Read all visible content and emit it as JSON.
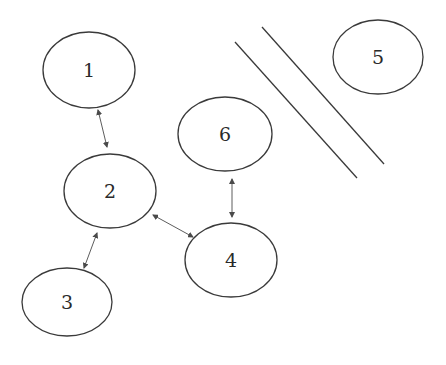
{
  "diagram": {
    "type": "node-graph",
    "colors": {
      "stroke": "#3a3a3a",
      "arrow": "#4a4a4a",
      "text": "#2a2a2a",
      "background": "#ffffff"
    },
    "nodes": [
      {
        "id": "1",
        "label": "1",
        "cx": 89,
        "cy": 70,
        "rx": 46,
        "ry": 38
      },
      {
        "id": "2",
        "label": "2",
        "cx": 110,
        "cy": 191,
        "rx": 46,
        "ry": 37
      },
      {
        "id": "3",
        "label": "3",
        "cx": 67,
        "cy": 302,
        "rx": 45,
        "ry": 34
      },
      {
        "id": "4",
        "label": "4",
        "cx": 231,
        "cy": 260,
        "rx": 46,
        "ry": 37
      },
      {
        "id": "5",
        "label": "5",
        "cx": 378,
        "cy": 57,
        "rx": 45,
        "ry": 37
      },
      {
        "id": "6",
        "label": "6",
        "cx": 225,
        "cy": 134,
        "rx": 47,
        "ry": 37
      }
    ],
    "edges": [
      {
        "from": "1",
        "to": "2",
        "bidirectional": true,
        "x1": 98,
        "y1": 110,
        "x2": 107,
        "y2": 147
      },
      {
        "from": "2",
        "to": "3",
        "bidirectional": true,
        "x1": 97,
        "y1": 233,
        "x2": 84,
        "y2": 268
      },
      {
        "from": "2",
        "to": "4",
        "bidirectional": true,
        "x1": 153,
        "y1": 215,
        "x2": 193,
        "y2": 237
      },
      {
        "from": "6",
        "to": "4",
        "bidirectional": true,
        "x1": 232,
        "y1": 179,
        "x2": 232,
        "y2": 217
      }
    ],
    "barrier_lines": [
      {
        "x1": 235,
        "y1": 42,
        "x2": 357,
        "y2": 178
      },
      {
        "x1": 262,
        "y1": 27,
        "x2": 384,
        "y2": 164
      }
    ]
  }
}
